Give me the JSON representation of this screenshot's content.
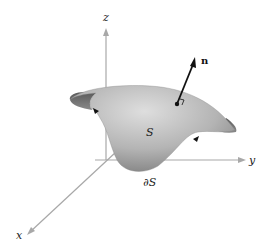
{
  "figure": {
    "axes": {
      "z_label": "z",
      "y_label": "y",
      "x_label": "x",
      "axis_color": "#a8a8a8"
    },
    "surface": {
      "label": "S",
      "boundary_label": "∂S",
      "fill_light": "#d4d4d4",
      "fill_dark": "#6a6a6a"
    },
    "normal_vector": {
      "label": "n",
      "color": "#111111"
    }
  }
}
